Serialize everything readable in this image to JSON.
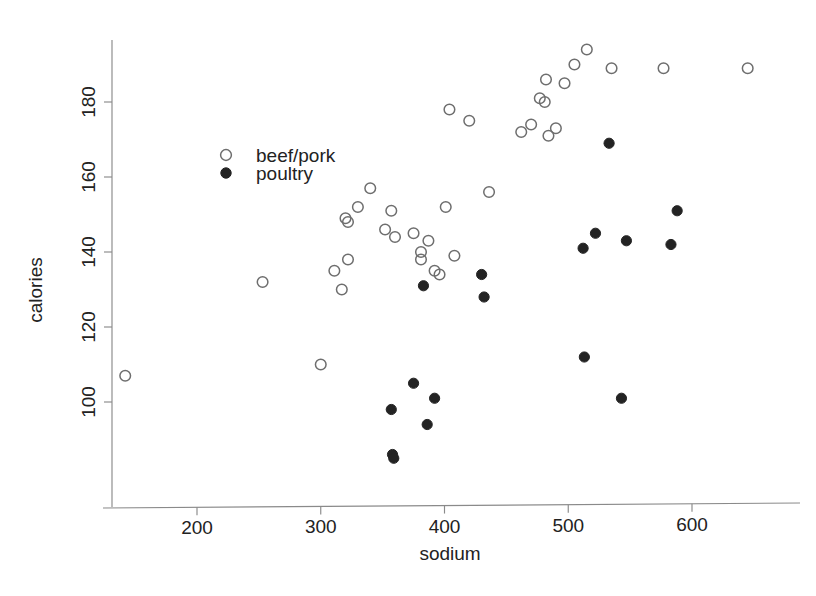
{
  "chart_data": {
    "type": "scatter",
    "title": "",
    "xlabel": "sodium",
    "ylabel": "calories",
    "xlim": [
      130,
      665
    ],
    "ylim": [
      83,
      196
    ],
    "xticks": [
      200,
      300,
      400,
      500,
      600
    ],
    "xticklabels": [
      "200",
      "300",
      "400",
      "500",
      "600"
    ],
    "yticks": [
      100,
      120,
      140,
      160,
      180
    ],
    "yticklabels": [
      "100",
      "120",
      "140",
      "160",
      "180"
    ],
    "grid": false,
    "legend_position": "upper-left-inside",
    "legend": [
      {
        "name": "beef/pork",
        "marker": "open-circle"
      },
      {
        "name": "poultry",
        "marker": "filled-circle"
      }
    ],
    "series": [
      {
        "name": "beef/pork",
        "marker": "open-circle",
        "color": "#6e6e6e",
        "points": [
          [
            142,
            107
          ],
          [
            253,
            132
          ],
          [
            300,
            110
          ],
          [
            311,
            135
          ],
          [
            317,
            130
          ],
          [
            320,
            149
          ],
          [
            322,
            148
          ],
          [
            322,
            138
          ],
          [
            330,
            152
          ],
          [
            340,
            157
          ],
          [
            352,
            146
          ],
          [
            357,
            151
          ],
          [
            360,
            144
          ],
          [
            375,
            145
          ],
          [
            381,
            140
          ],
          [
            381,
            138
          ],
          [
            387,
            143
          ],
          [
            392,
            135
          ],
          [
            396,
            134
          ],
          [
            401,
            152
          ],
          [
            404,
            178
          ],
          [
            408,
            139
          ],
          [
            420,
            175
          ],
          [
            436,
            156
          ],
          [
            462,
            172
          ],
          [
            470,
            174
          ],
          [
            477,
            181
          ],
          [
            481,
            180
          ],
          [
            482,
            186
          ],
          [
            484,
            171
          ],
          [
            490,
            173
          ],
          [
            497,
            185
          ],
          [
            505,
            190
          ],
          [
            515,
            194
          ],
          [
            535,
            189
          ],
          [
            577,
            189
          ],
          [
            645,
            189
          ]
        ]
      },
      {
        "name": "poultry",
        "marker": "filled-circle",
        "color": "#232323",
        "points": [
          [
            357,
            98
          ],
          [
            358,
            86
          ],
          [
            359,
            85
          ],
          [
            375,
            105
          ],
          [
            383,
            131
          ],
          [
            386,
            94
          ],
          [
            392,
            101
          ],
          [
            430,
            134
          ],
          [
            432,
            128
          ],
          [
            512,
            141
          ],
          [
            513,
            112
          ],
          [
            522,
            145
          ],
          [
            533,
            169
          ],
          [
            543,
            101
          ],
          [
            547,
            143
          ],
          [
            583,
            142
          ],
          [
            588,
            151
          ]
        ]
      }
    ]
  },
  "axes": {
    "x_title": "sodium",
    "y_title": "calories"
  }
}
